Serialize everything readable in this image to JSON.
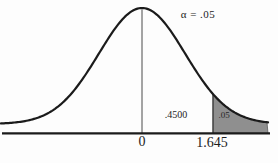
{
  "chart_data": {
    "type": "area",
    "distribution": "standard normal",
    "mean": 0,
    "critical_value": 1.645,
    "alpha": 0.05,
    "area_between_mean_and_critical": 0.45,
    "tail_area": 0.05,
    "x_ticks": [
      "0",
      "1.645"
    ],
    "shaded_region": "x > 1.645",
    "annotations": [
      "α = .05",
      ".4500",
      ".05"
    ],
    "legend_position": "none",
    "grid": false
  },
  "figure": {
    "alpha_label": "α = .05",
    "center_area_label": ".4500",
    "tail_area_label": ".05",
    "tick_zero": "0",
    "tick_critical": "1.645"
  },
  "colors": {
    "curve": "#1b1b1b",
    "axis": "#1b1b1b",
    "mean_line": "#4a4a4a",
    "critical_line": "#3a3a3a",
    "shade_fill": "#8f8f8f",
    "shade_edge": "#5a5a5a",
    "background": "#fdfdfd",
    "text": "#1c1c1c"
  }
}
